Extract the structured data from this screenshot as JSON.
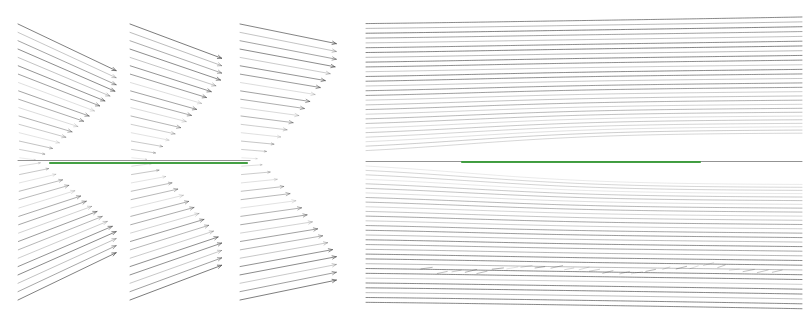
{
  "figure": {
    "title": "",
    "background_color": "#ffffff",
    "width": 804,
    "height": 315
  },
  "colors": {
    "vector_arrow": "#5a5a5a",
    "streamline": "#4a4a4a",
    "centerline": "#808080",
    "plate_green": "#3a9b3a",
    "background": "#ffffff"
  },
  "geometry": {
    "centerline_y": 160,
    "centerline_color": "#808080",
    "centerline_width": 1
  },
  "panels": [
    {
      "id": "panel-1",
      "name": "velocity-vectors-station-1",
      "type": "quiver",
      "x": 18,
      "y": 24,
      "width": 102,
      "height": 276,
      "rows": 34,
      "arrow_color": "#5a5a5a",
      "max_arrow_length": 100,
      "skew": 0.42,
      "label": ""
    },
    {
      "id": "panel-2",
      "name": "velocity-vectors-station-2",
      "type": "quiver",
      "x": 130,
      "y": 24,
      "width": 95,
      "height": 276,
      "rows": 34,
      "arrow_color": "#5a5a5a",
      "max_arrow_length": 93,
      "skew": 0.33,
      "label": ""
    },
    {
      "id": "panel-3",
      "name": "velocity-vectors-station-3",
      "type": "quiver",
      "x": 240,
      "y": 24,
      "width": 100,
      "height": 276,
      "rows": 34,
      "arrow_color": "#5a5a5a",
      "max_arrow_length": 98,
      "skew": 0.18,
      "label": ""
    },
    {
      "id": "panel-4",
      "name": "streamline-field",
      "type": "streamlines",
      "x": 366,
      "y": 24,
      "width": 436,
      "height": 278,
      "line_count": 58,
      "line_color": "#4a4a4a",
      "label": ""
    }
  ],
  "plate": {
    "name": "green-plate-line",
    "color": "#3a9b3a",
    "segments": [
      {
        "x1": 50,
        "x2": 247,
        "y": 163,
        "thickness": 2.2
      },
      {
        "x1": 462,
        "x2": 700,
        "y": 162,
        "thickness": 2.2
      }
    ]
  },
  "centerline_segments": [
    {
      "x1": 18,
      "x2": 250,
      "y": 160
    },
    {
      "x1": 366,
      "x2": 802,
      "y": 161
    }
  ],
  "chart_data": {
    "type": "scatter",
    "title": "",
    "xlabel": "",
    "ylabel": ""
  }
}
